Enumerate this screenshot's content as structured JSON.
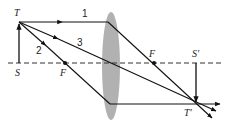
{
  "diagram": {
    "colors": {
      "lens": "#a9a9a9",
      "ray": "#111111",
      "axis": "#333333",
      "background": "#ffffff"
    },
    "labels": {
      "object_top": "T",
      "object_base": "S",
      "focal_left": "F",
      "focal_right": "F",
      "image_base": "S'",
      "image_top": "T'",
      "ray1": "1",
      "ray2": "2",
      "ray3": "3"
    },
    "points": {
      "S": [
        19,
        63
      ],
      "T": [
        19,
        22
      ],
      "F_left": [
        65,
        63
      ],
      "F_right": [
        154,
        63
      ],
      "lens_center": [
        111,
        63
      ],
      "S_prime": [
        196,
        63
      ],
      "T_prime": [
        196,
        104
      ]
    }
  }
}
